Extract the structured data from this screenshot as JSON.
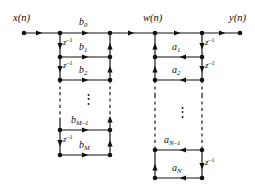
{
  "figure": {
    "type": "signal-flow-graph",
    "name": "direct-form-i-iir-filter",
    "width": 255,
    "height": 193,
    "background_color": "#ffffff",
    "line_color": "#101010",
    "text_color": "#0d0d0d"
  },
  "signals": {
    "input": "x(n)",
    "intermediate": "w(n)",
    "output": "y(n)"
  },
  "delay_label": "z",
  "delay_exponent": "-1",
  "feedforward": {
    "section_name": "numerator-b-coefficients",
    "arrow_direction": "right",
    "taps": [
      {
        "label": "b",
        "subscript": "0",
        "text": "b0"
      },
      {
        "label": "b",
        "subscript": "1",
        "text": "b1"
      },
      {
        "label": "b",
        "subscript": "2",
        "text": "b2"
      },
      {
        "label": "b",
        "subscript": "M-1",
        "text": "bM-1"
      },
      {
        "label": "b",
        "subscript": "M",
        "text": "bM"
      }
    ],
    "ellipsis": "⋮"
  },
  "feedback": {
    "section_name": "denominator-a-coefficients",
    "arrow_direction": "left",
    "taps": [
      {
        "label": "a",
        "subscript": "1",
        "text": "a1"
      },
      {
        "label": "a",
        "subscript": "2",
        "text": "a2"
      },
      {
        "label": "a",
        "subscript": "N-1",
        "text": "aN-1"
      },
      {
        "label": "a",
        "subscript": "N",
        "text": "aN"
      }
    ],
    "ellipsis": "⋮"
  },
  "labels": {
    "x_of_n": "x(n)",
    "w_of_n": "w(n)",
    "y_of_n": "y(n)",
    "b0": "b",
    "b0_sub": "0",
    "b1": "b",
    "b1_sub": "1",
    "b2": "b",
    "b2_sub": "2",
    "bM1": "b",
    "bM1_sub": "M–1",
    "bM": "b",
    "bM_sub": "M",
    "a1": "a",
    "a1_sub": "1",
    "a2": "a",
    "a2_sub": "2",
    "aN1": "a",
    "aN1_sub": "N–1",
    "aN": "a",
    "aN_sub": "N",
    "z": "z",
    "z_sup": "–1",
    "vdots_left": "⋮",
    "vdots_right": "⋮"
  }
}
